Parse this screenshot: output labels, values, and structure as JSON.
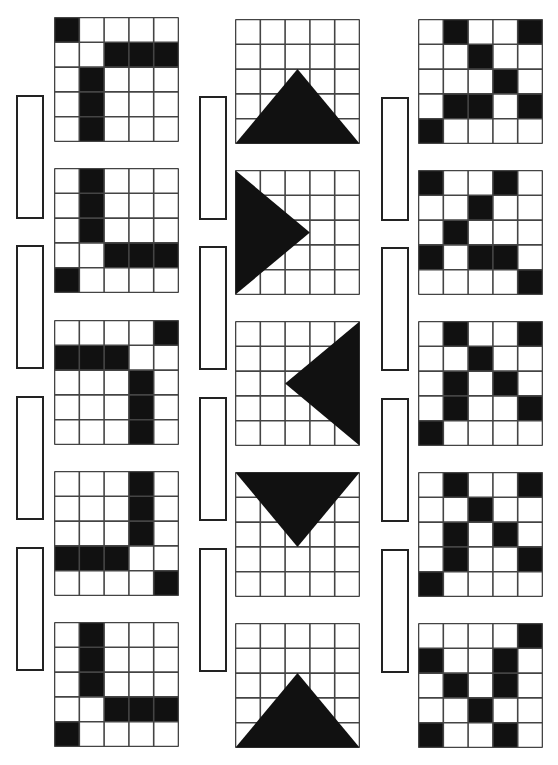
{
  "puzzle": {
    "grid_size": 5,
    "colors": {
      "fill": "#111111",
      "line": "#444444",
      "background": "#ffffff"
    },
    "columns": [
      {
        "id": "left",
        "type": "cells",
        "x": 54,
        "tops": [
          17,
          168,
          320,
          471,
          622
        ],
        "grids": [
          [
            [
              1,
              0,
              0,
              0,
              0
            ],
            [
              0,
              0,
              1,
              1,
              1
            ],
            [
              0,
              1,
              0,
              0,
              0
            ],
            [
              0,
              1,
              0,
              0,
              0
            ],
            [
              0,
              1,
              0,
              0,
              0
            ]
          ],
          [
            [
              0,
              1,
              0,
              0,
              0
            ],
            [
              0,
              1,
              0,
              0,
              0
            ],
            [
              0,
              1,
              0,
              0,
              0
            ],
            [
              0,
              0,
              1,
              1,
              1
            ],
            [
              1,
              0,
              0,
              0,
              0
            ]
          ],
          [
            [
              0,
              0,
              0,
              0,
              1
            ],
            [
              1,
              1,
              1,
              0,
              0
            ],
            [
              0,
              0,
              0,
              1,
              0
            ],
            [
              0,
              0,
              0,
              1,
              0
            ],
            [
              0,
              0,
              0,
              1,
              0
            ]
          ],
          [
            [
              0,
              0,
              0,
              1,
              0
            ],
            [
              0,
              0,
              0,
              1,
              0
            ],
            [
              0,
              0,
              0,
              1,
              0
            ],
            [
              1,
              1,
              1,
              0,
              0
            ],
            [
              0,
              0,
              0,
              0,
              1
            ]
          ],
          [
            [
              0,
              1,
              0,
              0,
              0
            ],
            [
              0,
              1,
              0,
              0,
              0
            ],
            [
              0,
              1,
              0,
              0,
              0
            ],
            [
              0,
              0,
              1,
              1,
              1
            ],
            [
              1,
              0,
              0,
              0,
              0
            ]
          ]
        ],
        "slots": {
          "x": 16,
          "tops": [
            95,
            245,
            396,
            547
          ]
        }
      },
      {
        "id": "middle",
        "type": "triangles",
        "x": 235,
        "tops": [
          19,
          170,
          321,
          472,
          623
        ],
        "triangles": [
          {
            "direction": "up",
            "points": [
              [
                0,
                5
              ],
              [
                5,
                5
              ],
              [
                2.5,
                2
              ]
            ]
          },
          {
            "direction": "right",
            "points": [
              [
                0,
                0
              ],
              [
                0,
                5
              ],
              [
                3,
                2.5
              ]
            ]
          },
          {
            "direction": "left",
            "points": [
              [
                5,
                0
              ],
              [
                5,
                5
              ],
              [
                2,
                2.5
              ]
            ]
          },
          {
            "direction": "down",
            "points": [
              [
                0,
                0
              ],
              [
                5,
                0
              ],
              [
                2.5,
                3
              ]
            ]
          },
          {
            "direction": "up",
            "points": [
              [
                0,
                5
              ],
              [
                5,
                5
              ],
              [
                2.5,
                2
              ]
            ]
          }
        ],
        "slots": {
          "x": 199,
          "tops": [
            96,
            246,
            397,
            548
          ]
        }
      },
      {
        "id": "right",
        "type": "cells",
        "x": 418,
        "tops": [
          19,
          170,
          321,
          472,
          623
        ],
        "grids": [
          [
            [
              0,
              1,
              0,
              0,
              1
            ],
            [
              0,
              0,
              1,
              0,
              0
            ],
            [
              0,
              0,
              0,
              1,
              0
            ],
            [
              0,
              1,
              1,
              0,
              1
            ],
            [
              1,
              0,
              0,
              0,
              0
            ]
          ],
          [
            [
              1,
              0,
              0,
              1,
              0
            ],
            [
              0,
              0,
              1,
              0,
              0
            ],
            [
              0,
              1,
              0,
              0,
              0
            ],
            [
              1,
              0,
              1,
              1,
              0
            ],
            [
              0,
              0,
              0,
              0,
              1
            ]
          ],
          [
            [
              0,
              1,
              0,
              0,
              1
            ],
            [
              0,
              0,
              1,
              0,
              0
            ],
            [
              0,
              1,
              0,
              1,
              0
            ],
            [
              0,
              1,
              0,
              0,
              1
            ],
            [
              1,
              0,
              0,
              0,
              0
            ]
          ],
          [
            [
              0,
              1,
              0,
              0,
              1
            ],
            [
              0,
              0,
              1,
              0,
              0
            ],
            [
              0,
              1,
              0,
              1,
              0
            ],
            [
              0,
              1,
              0,
              0,
              1
            ],
            [
              1,
              0,
              0,
              0,
              0
            ]
          ],
          [
            [
              0,
              0,
              0,
              0,
              1
            ],
            [
              1,
              0,
              0,
              1,
              0
            ],
            [
              0,
              1,
              0,
              1,
              0
            ],
            [
              0,
              0,
              1,
              0,
              0
            ],
            [
              1,
              0,
              0,
              1,
              0
            ]
          ]
        ],
        "slots": {
          "x": 381,
          "tops": [
            97,
            247,
            398,
            549
          ]
        }
      }
    ]
  }
}
